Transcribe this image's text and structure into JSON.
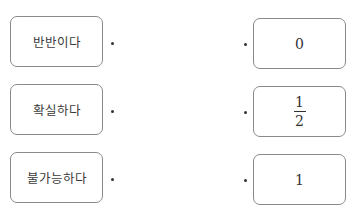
{
  "left_items": [
    {
      "label": "반반이다"
    },
    {
      "label": "확실하다"
    },
    {
      "label": "불가능하다"
    }
  ],
  "right_items": [
    {
      "value": "0"
    },
    {
      "numerator": "1",
      "denominator": "2"
    },
    {
      "value": "1"
    }
  ]
}
